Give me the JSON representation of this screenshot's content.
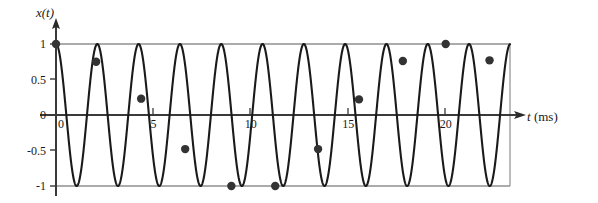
{
  "figure": {
    "name": "sampled-sinusoid-aliasing-plot",
    "x_axis_title_symbol": "t",
    "x_axis_title_unit": "(ms)",
    "y_axis_title": "x(t)",
    "origin_label": "0",
    "colors": {
      "curve": "#1a1a1a",
      "axis": "#3a3a3a",
      "gridline": "#8a8a8a",
      "marker": "#333333",
      "background": "#ffffff"
    }
  },
  "chart_data": {
    "type": "line",
    "title": "",
    "xlabel": "t (ms)",
    "ylabel": "x(t)",
    "xlim": [
      0,
      23.3
    ],
    "ylim": [
      -1,
      1
    ],
    "grid": true,
    "gridlines_y": [
      1,
      -1
    ],
    "legend": null,
    "xticks": [
      0,
      5,
      10,
      15,
      20
    ],
    "xtick_labels": [
      "0",
      "5",
      "10",
      "15",
      "20"
    ],
    "yticks": [
      1,
      0.5,
      0,
      -0.5,
      -1
    ],
    "ytick_labels": [
      "1",
      "0.5",
      "0",
      "-0.5",
      "-1"
    ],
    "series": [
      {
        "name": "continuous signal x(t)",
        "type": "line",
        "form": "cosine",
        "amplitude": 1,
        "period_ms": 2.12,
        "frequency_khz": 0.4717,
        "phase_deg": 0,
        "x_start": 0,
        "x_end": 23.3
      },
      {
        "name": "sampled points",
        "type": "scatter",
        "sample_interval_ms": 2.24,
        "points": [
          {
            "t": 0.0,
            "x": 1.0
          },
          {
            "t": 2.06,
            "x": 0.75
          },
          {
            "t": 4.37,
            "x": 0.23
          },
          {
            "t": 6.63,
            "x": -0.48
          },
          {
            "t": 9.0,
            "x": -1.0
          },
          {
            "t": 11.25,
            "x": -1.0
          },
          {
            "t": 13.45,
            "x": -0.48
          },
          {
            "t": 15.55,
            "x": 0.22
          },
          {
            "t": 17.8,
            "x": 0.76
          },
          {
            "t": 20.0,
            "x": 1.0
          },
          {
            "t": 22.25,
            "x": 0.77
          }
        ]
      }
    ]
  }
}
